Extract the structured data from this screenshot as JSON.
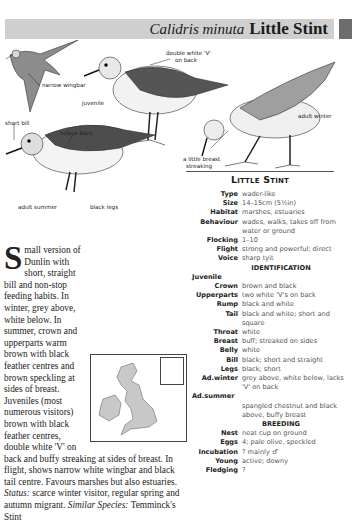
{
  "header": {
    "latin_name": "Calidris minuta",
    "common_name": "Little Stint"
  },
  "illustration_labels": {
    "narrow_wingbar": "narrow wingbar",
    "double_white_v": "double white 'V'",
    "double_white_v_2": "on back",
    "juvenile": "juvenile",
    "short_bill": "short bill",
    "rufous_back": "rufous back",
    "adult_winter": "adult winter",
    "breast_streaking": "a little breast",
    "breast_streaking_2": "streaking",
    "adult_summer": "adult summer",
    "black_legs": "black legs"
  },
  "factfile": {
    "title": "Little Stint",
    "general": [
      {
        "key": "Type",
        "value": "wader-like"
      },
      {
        "key": "Size",
        "value": "14–15cm (5½in)"
      },
      {
        "key": "Habitat",
        "value": "marshes, estuaries"
      },
      {
        "key": "Behaviour",
        "value": "wades, walks,  takes off from water or ground"
      },
      {
        "key": "Flocking",
        "value": "1–10"
      },
      {
        "key": "Flight",
        "value": "strong and powerful; direct"
      },
      {
        "key": "Voice",
        "value": "sharp tyit"
      }
    ],
    "identification_heading": "IDENTIFICATION",
    "juvenile_heading": "Juvenile",
    "identification": [
      {
        "key": "Crown",
        "value": "brown and black"
      },
      {
        "key": "Upperparts",
        "value": "two white 'V's on back"
      },
      {
        "key": "Rump",
        "value": "black and white"
      },
      {
        "key": "Tail",
        "value": "black and white; short and square"
      },
      {
        "key": "Throat",
        "value": "white"
      },
      {
        "key": "Breast",
        "value": "buff; streaked on sides"
      },
      {
        "key": "Belly",
        "value": "white"
      },
      {
        "key": "Bill",
        "value": "black; short and straight"
      },
      {
        "key": "Legs",
        "value": "black; short"
      },
      {
        "key": "Ad.winter",
        "value": "grey above, white below, lacks 'V' on back"
      }
    ],
    "summer_heading": "Ad.summer",
    "summer_value": "spangled chestnut and black above, buffy breast",
    "breeding_heading": "BREEDING",
    "breeding": [
      {
        "key": "Nest",
        "value": "neat cup on ground"
      },
      {
        "key": "Eggs",
        "value": "4; pale olive, speckled"
      },
      {
        "key": "Incubation",
        "value": "? mainly ♂"
      },
      {
        "key": "Young",
        "value": "active; downy"
      },
      {
        "key": "Fledging",
        "value": "?"
      }
    ]
  },
  "description": {
    "dropcap": "S",
    "text": "mall version of Dunlin with short, straight bill and non-stop feeding habits. In winter, grey above, white below. In summer, crown and upperparts warm brown with black feather centres and brown speckling at sides of breast. Juveniles (most numerous visitors) brown with black feather centres, double white 'V' on back and buffy streaking at sides of breast. In flight, shows narrow white wingbar and black tail centre. Favours marshes but also estuaries.",
    "status_label": "Status:",
    "status_text": "scarce winter visitor, regular spring and autumn migrant.",
    "similar_label": "Similar Species:",
    "similar_text": "Temminck's Stint"
  },
  "colors": {
    "title_band": "#cfcfcf",
    "edge_tab": "#6d6d6d",
    "map_land": "#c8c8c8"
  }
}
